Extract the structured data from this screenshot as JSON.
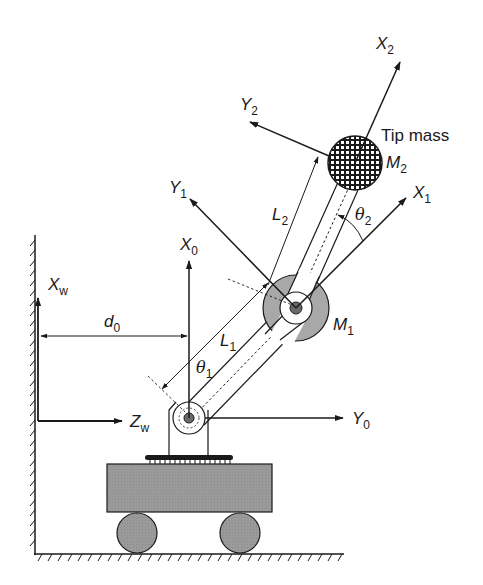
{
  "diagram": {
    "colors": {
      "stroke": "#1a1a1a",
      "mass_gray": "#a0a0a0",
      "cart_gray": "#9a9a9a",
      "background": "#ffffff"
    },
    "labels": {
      "x2": {
        "main": "X",
        "sub": "2"
      },
      "y2": {
        "main": "Y",
        "sub": "2"
      },
      "tip_mass": "Tip mass",
      "m2": {
        "main": "M",
        "sub": "2"
      },
      "y1": {
        "main": "Y",
        "sub": "1"
      },
      "x1": {
        "main": "X",
        "sub": "1"
      },
      "l2": {
        "main": "L",
        "sub": "2"
      },
      "theta2": {
        "main": "θ",
        "sub": "2"
      },
      "x0": {
        "main": "X",
        "sub": "0"
      },
      "xw": {
        "main": "X",
        "sub": "w"
      },
      "d0": {
        "main": "d",
        "sub": "0"
      },
      "l1": {
        "main": "L",
        "sub": "1"
      },
      "m1": {
        "main": "M",
        "sub": "1"
      },
      "theta1": {
        "main": "θ",
        "sub": "1"
      },
      "zw": {
        "main": "Z",
        "sub": "w"
      },
      "y0": {
        "main": "Y",
        "sub": "0"
      }
    },
    "components": [
      "wall",
      "floor",
      "cart",
      "wheels",
      "base-joint",
      "link-1",
      "elbow-joint-mass-M1",
      "link-2",
      "tip-mass-M2"
    ]
  }
}
